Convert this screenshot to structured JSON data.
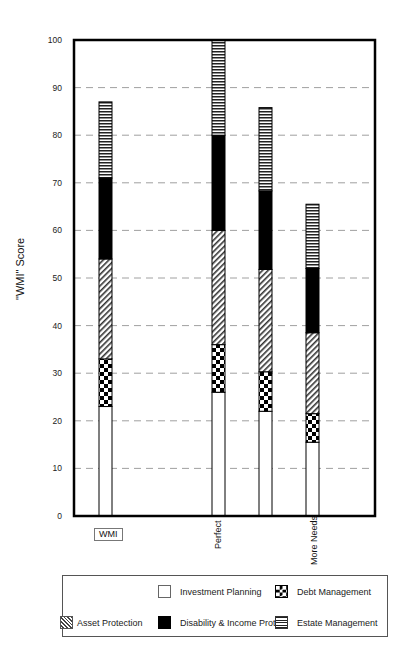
{
  "chart_data": {
    "type": "bar",
    "stacked": true,
    "title": "",
    "xlabel": "",
    "ylabel": "\"WMI\" Score",
    "ylim": [
      0,
      100
    ],
    "yticks": [
      0,
      10,
      20,
      30,
      40,
      50,
      60,
      70,
      80,
      90,
      100
    ],
    "grid": "horizontal dashed",
    "legend_position": "bottom (boxed)",
    "categories": [
      "WMI",
      "Perfect",
      "",
      "More Needs"
    ],
    "category_labels_display": {
      "WMI": "boxed",
      "Perfect": "rotated",
      "More Needs": "rotated"
    },
    "series": [
      {
        "name": "Investment Planning",
        "pattern": "white",
        "values": [
          23,
          26,
          22,
          15.5
        ]
      },
      {
        "name": "Debt Management",
        "pattern": "checkerboard",
        "values": [
          10,
          10,
          8.3,
          6
        ]
      },
      {
        "name": "Asset Protection",
        "pattern": "diagonal-hatch",
        "values": [
          21,
          24,
          21.5,
          17
        ]
      },
      {
        "name": "Disability & Income Prot",
        "pattern": "solid-black",
        "values": [
          17,
          20,
          16.5,
          13.5
        ]
      },
      {
        "name": "Estate Management",
        "pattern": "horizontal-stripes",
        "values": [
          16,
          20,
          17.5,
          13.5
        ]
      }
    ],
    "totals": [
      87,
      100,
      85.8,
      65.5
    ]
  },
  "legend": {
    "items": [
      {
        "label": "Investment Planning"
      },
      {
        "label": "Debt Management"
      },
      {
        "label": "Asset Protection"
      },
      {
        "label": "Disability & Income Prot"
      },
      {
        "label": "Estate Management"
      }
    ]
  },
  "axis": {
    "ylabel": "\"WMI\" Score"
  },
  "xlabels": {
    "bar1": "WMI",
    "bar2": "Perfect",
    "bar4": "More Needs"
  }
}
